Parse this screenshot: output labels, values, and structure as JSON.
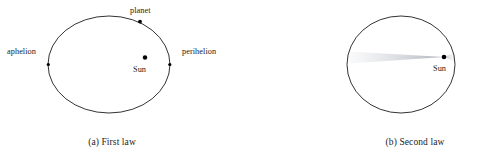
{
  "figure": {
    "background_color": "#ffffff",
    "stroke_color": "#1c1c1c",
    "marker_color": "#000000",
    "sector_color": "#b9bcc4"
  },
  "panels": [
    {
      "id": "first-law",
      "caption": "(a) First law",
      "ellipse": {
        "cx": 109,
        "cy": 64.5,
        "rx": 61,
        "ry": 48.5
      },
      "markers": [
        {
          "name": "aphelion-point",
          "label": "aphelion",
          "x": 48,
          "y": 64.5
        },
        {
          "name": "perihelion-point",
          "label": "perihelion",
          "x": 170,
          "y": 64.5
        },
        {
          "name": "planet-point",
          "label": "planet",
          "x": 140,
          "y": 21.5
        },
        {
          "name": "sun-point",
          "label": "Sun",
          "x": 145,
          "y": 57.5
        }
      ]
    },
    {
      "id": "second-law",
      "caption": "(b) Second law",
      "ellipse": {
        "cx": 401,
        "cy": 64.5,
        "rx": 54,
        "ry": 48.5
      },
      "markers": [
        {
          "name": "sun-point",
          "label": "Sun",
          "x": 444,
          "y": 57
        }
      ],
      "swept_sector": {
        "name": "equal-area-sector",
        "apex_x": 444,
        "apex_y": 57,
        "sweep_to_x": 347,
        "sweep_top_y": 53,
        "sweep_bottom_y": 63
      }
    }
  ],
  "labels": {
    "aphelion": "aphelion",
    "perihelion": "perihelion",
    "planet": "planet",
    "sun": "Sun"
  },
  "captions": {
    "first_law": "(a) First law",
    "second_law": "(b) Second law"
  }
}
